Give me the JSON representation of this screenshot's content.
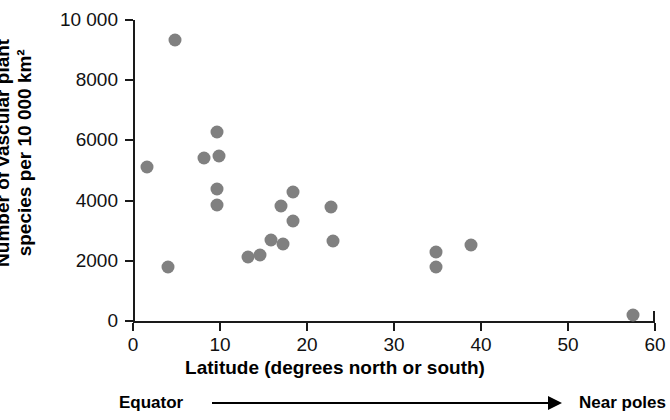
{
  "chart_data": {
    "type": "scatter",
    "title": "",
    "xlabel": "Latitude (degrees north or south)",
    "ylabel_line1": "Number of vascular plant",
    "ylabel_line2": "species per 10 000 km²",
    "xlim": [
      0,
      60
    ],
    "ylim": [
      0,
      10000
    ],
    "xticks": [
      0,
      10,
      20,
      30,
      40,
      50,
      60
    ],
    "xtick_labels": [
      "0",
      "10",
      "20",
      "30",
      "40",
      "50",
      "60"
    ],
    "yticks": [
      0,
      2000,
      4000,
      6000,
      8000,
      10000
    ],
    "ytick_labels": [
      "0",
      "2000",
      "4000",
      "6000",
      "8000",
      "10 000"
    ],
    "grid": false,
    "legend": null,
    "marker_color": "#808080",
    "axis_color": "#1a1a1a",
    "points": [
      {
        "x": 1.6,
        "y": 5130
      },
      {
        "x": 4.8,
        "y": 9340
      },
      {
        "x": 4.0,
        "y": 1780
      },
      {
        "x": 8.2,
        "y": 5430
      },
      {
        "x": 9.6,
        "y": 6280
      },
      {
        "x": 9.9,
        "y": 5470
      },
      {
        "x": 9.6,
        "y": 4400
      },
      {
        "x": 9.6,
        "y": 3870
      },
      {
        "x": 13.2,
        "y": 2130
      },
      {
        "x": 14.6,
        "y": 2200
      },
      {
        "x": 15.9,
        "y": 2690
      },
      {
        "x": 17.0,
        "y": 3830
      },
      {
        "x": 17.2,
        "y": 2570
      },
      {
        "x": 18.4,
        "y": 4300
      },
      {
        "x": 18.4,
        "y": 3320
      },
      {
        "x": 22.8,
        "y": 3800
      },
      {
        "x": 23.0,
        "y": 2650
      },
      {
        "x": 34.8,
        "y": 2280
      },
      {
        "x": 34.8,
        "y": 1780
      },
      {
        "x": 38.9,
        "y": 2530
      },
      {
        "x": 57.5,
        "y": 200
      }
    ]
  },
  "annotation": {
    "left_label": "Equator",
    "right_label": "Near poles",
    "arrow": "right-arrow-icon"
  }
}
